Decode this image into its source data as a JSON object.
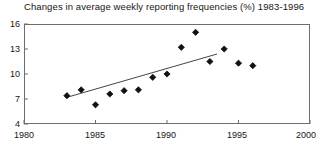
{
  "chart_data": {
    "type": "scatter",
    "title": "Changes in average weekly reporting frequencies (%) 1983-1996",
    "xlabel": "",
    "ylabel": "",
    "xlim": [
      1980,
      2000
    ],
    "ylim": [
      4,
      16
    ],
    "grid": false,
    "legend": null,
    "x_ticks": [
      1980,
      1985,
      1990,
      1995,
      2000
    ],
    "y_ticks": [
      4,
      7,
      10,
      13,
      16
    ],
    "x": [
      1983,
      1984,
      1985,
      1986,
      1987,
      1988,
      1989,
      1990,
      1991,
      1992,
      1993,
      1994,
      1995,
      1996
    ],
    "values": [
      7.4,
      8.1,
      6.3,
      7.6,
      8.0,
      8.1,
      9.6,
      10.0,
      13.2,
      15.0,
      11.5,
      13.0,
      11.3,
      11.0
    ],
    "series": [
      {
        "name": "reporting frequency",
        "values": [
          7.4,
          8.1,
          6.3,
          7.6,
          8.0,
          8.1,
          9.6,
          10.0,
          13.2,
          15.0,
          11.5,
          13.0,
          11.3,
          11.0
        ]
      }
    ],
    "trendline": {
      "type": "linear",
      "x_start": 1983,
      "y_start": 7.2,
      "x_end": 1993.5,
      "y_end": 12.4
    },
    "marker": "filled-diamond",
    "marker_color": "#111111",
    "line_color": "#444444",
    "axis_color": "#6e6e6e"
  },
  "axis": {
    "y_labels": [
      "16",
      "13",
      "10",
      "7",
      "4"
    ],
    "x_labels": [
      "1980",
      "1985",
      "1990",
      "1995",
      "2000"
    ]
  }
}
